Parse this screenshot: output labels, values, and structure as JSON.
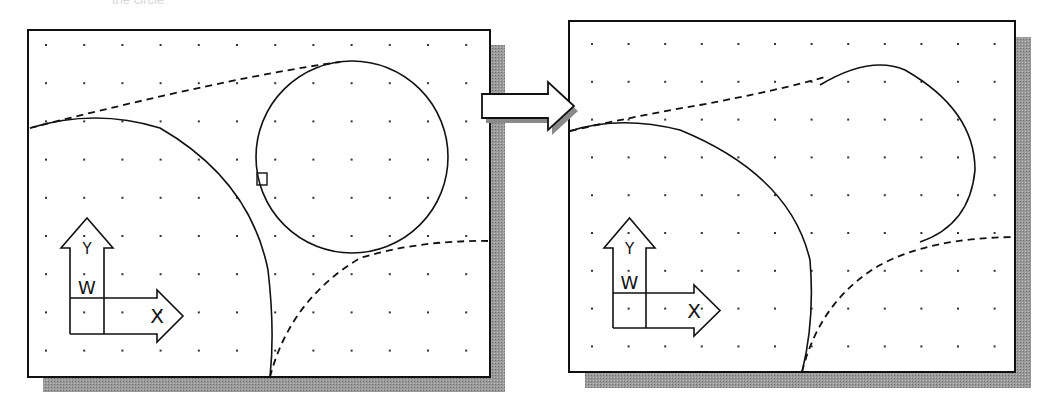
{
  "caption_fragment": "the circle",
  "colors": {
    "line": "#111111",
    "dot": "#333333",
    "shadow": "#8a8a8a",
    "bg": "#ffffff"
  },
  "panels": [
    {
      "name": "before",
      "frame": {
        "x": 28,
        "y": 30,
        "w": 462,
        "h": 347
      },
      "shadow_offset": 15,
      "grid": {
        "x0": 46,
        "y0": 45,
        "dx": 38.2,
        "dy": 38.2,
        "cols": 12,
        "rows": 9
      },
      "circle": {
        "cx": 352,
        "cy": 157,
        "r": 96
      },
      "pick_box": {
        "x": 257,
        "y": 173,
        "w": 10,
        "h": 12
      },
      "big_arc": "M 30 128 Q 95 108 160 128 Q 250 180 268 270 Q 275 330 270 377",
      "dashed_upper": "M 30 128 Q 100 110 180 92 Q 280 70 340 62",
      "dashed_lower": "M 270 377 Q 290 300 360 258 Q 420 240 488 241",
      "ucs": {
        "x": 70,
        "y": 218,
        "stem_w": 34,
        "box_top": 298,
        "box_bot": 334,
        "tip_x": 183,
        "label_y": "Y",
        "label_w": "W",
        "label_x": "X"
      }
    },
    {
      "name": "after",
      "frame": {
        "x": 569,
        "y": 21,
        "w": 446,
        "h": 351
      },
      "shadow_offset": 16,
      "grid": {
        "x0": 592,
        "y0": 44,
        "dx": 36.6,
        "dy": 37.8,
        "cols": 12,
        "rows": 9
      },
      "trimmed_arc": "M 820 85 Q 870 55 905 70 Q 975 110 975 170 Q 970 225 920 242",
      "pick_box": null,
      "big_arc": "M 570 131 Q 620 115 680 130 Q 790 175 810 260 Q 815 320 802 372",
      "dashed_upper": "M 570 131 Q 640 115 700 105 Q 780 90 825 77",
      "dashed_lower": "M 802 372 Q 820 300 880 265 Q 930 238 1014 237",
      "ucs": {
        "x": 613,
        "y": 218,
        "stem_w": 33,
        "box_top": 293,
        "box_bot": 328,
        "tip_x": 720,
        "label_y": "Y",
        "label_w": "W",
        "label_x": "X"
      }
    }
  ],
  "transition_arrow": {
    "x": 482,
    "y": 82,
    "w": 92,
    "h": 48,
    "direction": "right"
  }
}
